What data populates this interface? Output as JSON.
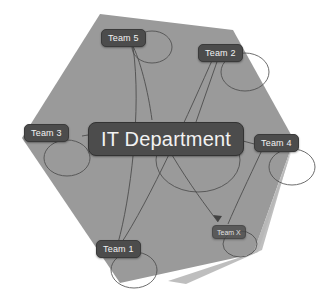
{
  "diagram": {
    "title": "IT Department",
    "background_color": "#ffffff",
    "hull_color": "#9a9a9a",
    "wedge_color": "#b4b4b4",
    "node_fill": "#4c4c4c",
    "node_text_color": "#f2f2f2",
    "edge_color": "#4a4a4a",
    "center": {
      "label": "IT Department"
    },
    "nodes": [
      {
        "label": "Team 5"
      },
      {
        "label": "Team 2"
      },
      {
        "label": "Team 3"
      },
      {
        "label": "Team 4"
      },
      {
        "label": "Team 1"
      },
      {
        "label": "Team X"
      }
    ]
  }
}
